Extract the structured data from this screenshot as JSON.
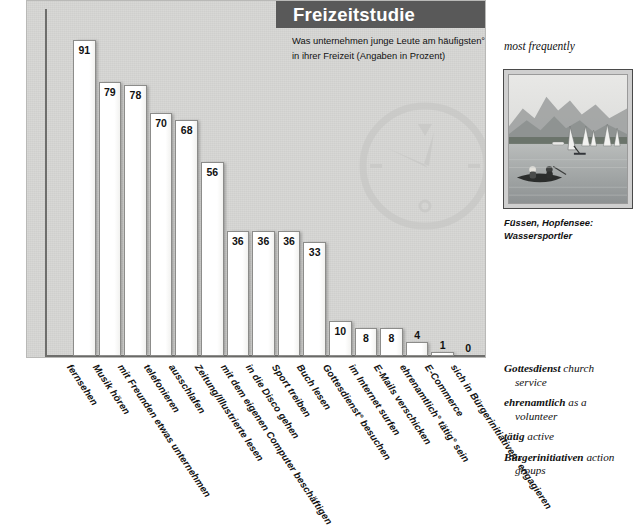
{
  "header": {
    "title": "Freizeitstudie",
    "subtitle_line1": "Was unternehmen junge Leute am häufigsten°",
    "subtitle_line2": "in ihrer Freizeit (Angaben in Prozent)"
  },
  "chart_data": {
    "type": "bar",
    "title": "Freizeitstudie",
    "subtitle": "Was unternehmen junge Leute am häufigsten° in ihrer Freizeit (Angaben in Prozent)",
    "xlabel": "",
    "ylabel": "Prozent",
    "ylim": [
      0,
      100
    ],
    "grid": false,
    "legend": "none",
    "categories": [
      "fernsehen",
      "Musik hören",
      "mit Freunden etwas unternehmen",
      "telefonieren",
      "ausschlafen",
      "Zeitung/Illustrierte lesen",
      "mit dem eigenen Computer beschäftigen",
      "in die Disco gehen",
      "Sport treiben",
      "Buch lesen",
      "Gottesdienst° besuchen",
      "im Internet surfen",
      "E-Mails verschicken",
      "ehrenamtlich° tätig° sein",
      "E-Commerce",
      "sich in Bürgerinitiativen° engagieren"
    ],
    "values": [
      91,
      79,
      78,
      70,
      68,
      56,
      36,
      36,
      36,
      33,
      10,
      8,
      8,
      4,
      1,
      0
    ],
    "value_labels": [
      "91",
      "79",
      "78",
      "70",
      "68",
      "56",
      "36",
      "36",
      "36",
      "33",
      "10",
      "8",
      "8",
      "4",
      "1",
      "0"
    ],
    "units": "percent"
  },
  "watermark": {
    "icon": "clock-icon"
  },
  "sidebar": {
    "most_frequently": "most frequently",
    "photo_alt": "Lake with sailboats, windsurfer and canoe in front of mountains",
    "photo_caption_line1": "Füssen, Hopfensee:",
    "photo_caption_line2": "Wassersportler",
    "glossary": [
      {
        "term": "Gottesdienst",
        "definition": "church",
        "continuation": "service"
      },
      {
        "term": "ehrenamtlich",
        "definition": "as a",
        "continuation": "volunteer"
      },
      {
        "term": "tätig",
        "definition": "active",
        "continuation": ""
      },
      {
        "term": "Bürgerinitiativen",
        "definition": "action",
        "continuation": "groups"
      }
    ]
  },
  "colors": {
    "panel_bg": "#d6d6d4",
    "header_bar": "#595959",
    "bar_fill": "#ffffff",
    "bar_stroke": "#8c8c8a",
    "axis": "#6e6e6c",
    "text": "#111111"
  }
}
